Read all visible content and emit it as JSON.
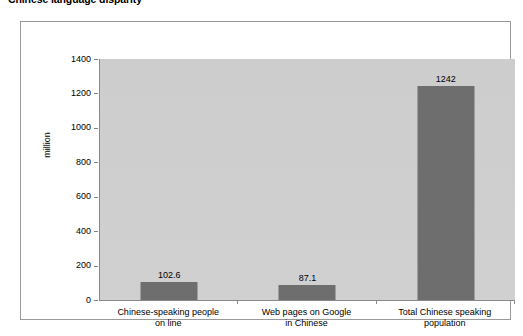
{
  "chart_data": {
    "type": "bar",
    "title": "Chinese language disparity",
    "xlabel": "",
    "ylabel": "million",
    "ylim": [
      0,
      1400
    ],
    "ytick_step": 200,
    "yticks": [
      1400,
      1200,
      1000,
      800,
      600,
      400,
      200,
      0
    ],
    "grid": false,
    "legend": "none",
    "categories": [
      "Chinese-speaking people\non line",
      "Web pages on Google\nin Chinese",
      "Total Chinese speaking\npopulation"
    ],
    "values": [
      102.6,
      87.1,
      1242
    ],
    "value_labels": [
      "102.6",
      "87.1",
      "1242"
    ],
    "colors": {
      "bar_fill": "#6e6e6e",
      "plot_background": "#cfcfcf",
      "page_background": "#ffffff",
      "axis_line": "#8a8a8a",
      "frame_border": "#9a9a9a",
      "text": "#000000"
    }
  }
}
